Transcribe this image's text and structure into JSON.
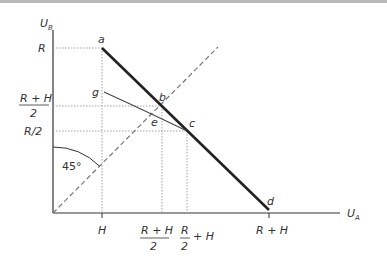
{
  "axes": {
    "y_label": "U",
    "y_sub": "B",
    "x_label": "U",
    "x_sub": "A"
  },
  "y_ticks": {
    "R": "R",
    "rh2_num": "R + H",
    "rh2_den": "2",
    "r2": "R/2"
  },
  "x_ticks": {
    "H": "H",
    "rh2_num": "R + H",
    "rh2_den": "2",
    "r2h_num": "R",
    "r2h_den": "2",
    "r2h_plus": "+ H",
    "RH": "R + H"
  },
  "points": {
    "a": "a",
    "b": "b",
    "c": "c",
    "d": "d",
    "e": "e",
    "g": "g"
  },
  "angle_label": "45°",
  "colors": {
    "frontier": "#222222",
    "curve": "#444444",
    "dashed": "#777777",
    "dotted": "#999999"
  }
}
